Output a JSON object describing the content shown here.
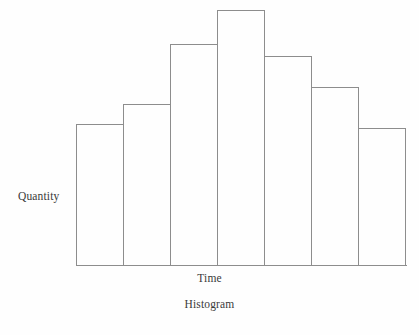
{
  "figure": {
    "caption": "Histogram",
    "background_color": "#fefefe",
    "stroke_color": "#8d8d8d",
    "text_color": "#3a3a3a"
  },
  "chart_data": {
    "type": "bar",
    "title": "Histogram",
    "xlabel": "Time",
    "ylabel": "Quantity",
    "categories": [
      "1",
      "2",
      "3",
      "4",
      "5",
      "6",
      "7"
    ],
    "tick_labels": [],
    "values": [
      55.2,
      63.2,
      86.8,
      100.0,
      82.0,
      70.0,
      53.6
    ],
    "ylim": [
      0,
      100
    ],
    "xlim": [
      0,
      7
    ],
    "grid": false,
    "legend": false,
    "legend_position": "none",
    "bar_fill": "none",
    "bar_edge_color": "#8d8d8d",
    "bar_gap": 0,
    "annotations": []
  },
  "axes": {
    "y_label": "Quantity",
    "x_label": "Time"
  }
}
